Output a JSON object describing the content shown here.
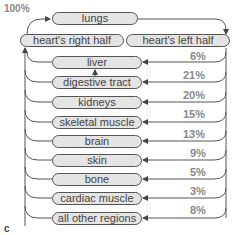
{
  "diagram": {
    "panel_label": "c",
    "total_label": "100%",
    "top": {
      "lungs": "lungs",
      "heart_right": "heart's right half",
      "heart_left": "heart's left half"
    },
    "organs": [
      {
        "name": "liver",
        "pct": "6%"
      },
      {
        "name": "digestive tract",
        "pct": "21%"
      },
      {
        "name": "kidneys",
        "pct": "20%"
      },
      {
        "name": "skeletal muscle",
        "pct": "15%"
      },
      {
        "name": "brain",
        "pct": "13%"
      },
      {
        "name": "skin",
        "pct": "9%"
      },
      {
        "name": "bone",
        "pct": "5%"
      },
      {
        "name": "cardiac muscle",
        "pct": "3%"
      },
      {
        "name": "all other regions",
        "pct": "8%"
      }
    ],
    "colors": {
      "box_fill": "#e4e4e4",
      "line": "#555555",
      "pct_text": "#888888"
    }
  }
}
